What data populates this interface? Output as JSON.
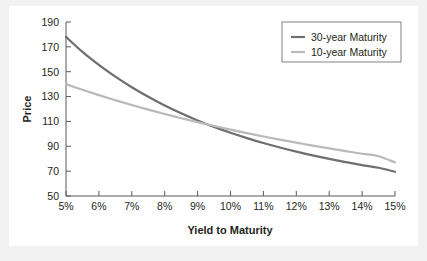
{
  "chart_data": {
    "type": "line",
    "title": "",
    "xlabel": "Yield to Maturity",
    "ylabel": "Price",
    "xlim": [
      5,
      15
    ],
    "ylim": [
      50,
      190
    ],
    "grid": false,
    "legend_position": "top-right",
    "x_tick_labels": [
      "5%",
      "6%",
      "7%",
      "8%",
      "9%",
      "10%",
      "11%",
      "12%",
      "13%",
      "14%",
      "15%"
    ],
    "x_tick_values": [
      5,
      6,
      7,
      8,
      9,
      10,
      11,
      12,
      13,
      14,
      15
    ],
    "y_tick_labels": [
      "50",
      "70",
      "90",
      "110",
      "130",
      "150",
      "170",
      "190"
    ],
    "y_tick_values": [
      50,
      70,
      90,
      110,
      130,
      150,
      170,
      190
    ],
    "x": [
      5,
      5.5,
      6,
      6.5,
      7,
      7.5,
      8,
      8.5,
      9,
      9.5,
      10,
      10.5,
      11,
      11.5,
      12,
      12.5,
      13,
      13.5,
      14,
      14.5,
      15
    ],
    "series": [
      {
        "name": "30-year Maturity",
        "color": "#6e6e6e",
        "width": 2.2,
        "values": [
          178.0,
          166.0,
          155.5,
          146.0,
          137.5,
          129.8,
          122.8,
          116.5,
          110.8,
          105.6,
          100.9,
          96.6,
          92.6,
          89.0,
          85.7,
          82.7,
          79.9,
          77.3,
          74.9,
          72.7,
          69.5
        ]
      },
      {
        "name": "10-year Maturity",
        "color": "#b9b9b9",
        "width": 2.2,
        "values": [
          140.0,
          135.5,
          131.2,
          127.1,
          123.2,
          119.5,
          116.0,
          112.6,
          109.4,
          106.3,
          103.4,
          100.6,
          97.9,
          95.4,
          92.9,
          90.5,
          88.3,
          86.1,
          84.0,
          82.0,
          77.0
        ]
      }
    ],
    "legend": [
      {
        "label": "30-year Maturity",
        "color": "#6e6e6e"
      },
      {
        "label": "10-year Maturity",
        "color": "#b9b9b9"
      }
    ]
  }
}
